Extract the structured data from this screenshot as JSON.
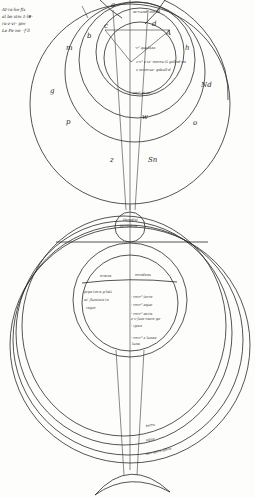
{
  "figure": {
    "type": "manuscript-cosmological-diagram",
    "marginal_note": [
      "AI·ra·ho·fix",
      "al bo vim 1·l#·",
      "ra·z·vr· pm·",
      "Le Fe no· ·f·ll"
    ],
    "upper_diagram": {
      "letters": {
        "a": "a",
        "b": "b",
        "c": "c",
        "d": "d",
        "e_top": "a",
        "m_left": "m",
        "g_left": "g",
        "p_left": "p",
        "h_right": "h",
        "n_right": "n",
        "nd_right": "Nd",
        "o_right": "o",
        "z_lower": "z",
        "sn_lower": "Sn",
        "w_mid": "w",
        "small_right": "A"
      },
      "glosses": [
        "se·cund· mo·",
        "·c⁹ qualitas",
        "v·c⁹ x·tz· morcu·lt gsllnd·mt",
        "z mrtoruz· gsbull·d",
        "cor⁹ pt·se·"
      ]
    },
    "lower_diagram": {
      "top_circle": [
        "Paradisi",
        "terrestris"
      ],
      "hemisphere_labels": {
        "left": "oriens",
        "right": "occidens"
      },
      "left_text": [
        "prps·tm·a g·lati",
        "ai· fluminis·in",
        "regio"
      ],
      "right_ticks": [
        "· corr⁹ terre",
        "· corr⁹ aque",
        "· corr⁹ aeris",
        "z·v·fum·ciare gs·",
        "· ignis",
        "· corr⁹ z lunae",
        "luna"
      ],
      "band_labels": [
        "terra",
        "aqua",
        "aer·ignis·sfera"
      ]
    }
  }
}
